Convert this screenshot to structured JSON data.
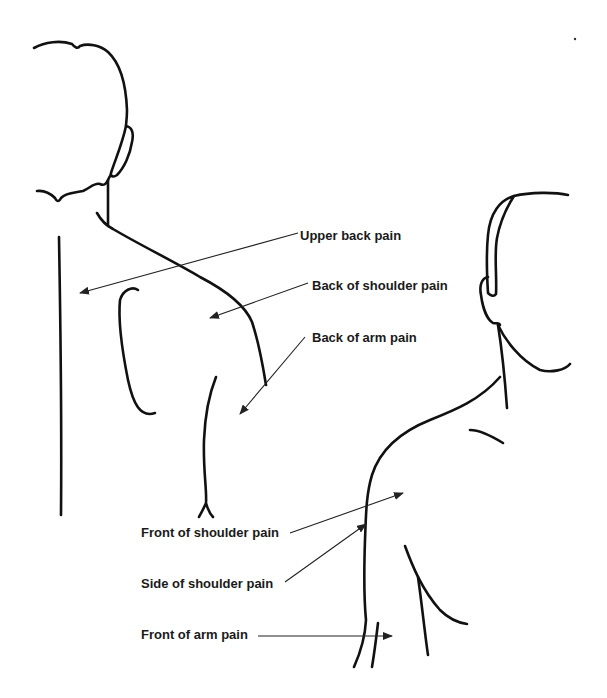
{
  "diagram": {
    "figures": [
      {
        "name": "back-view-figure",
        "view": "back"
      },
      {
        "name": "front-view-figure",
        "view": "front"
      }
    ],
    "labels": [
      {
        "id": "upper-back",
        "text": "Upper back pain",
        "x": 300,
        "y": 229,
        "target": [
          80,
          293
        ]
      },
      {
        "id": "back-shoulder",
        "text": "Back of shoulder pain",
        "x": 312,
        "y": 279,
        "target": [
          210,
          318
        ]
      },
      {
        "id": "back-arm",
        "text": "Back of arm pain",
        "x": 312,
        "y": 331,
        "target": [
          240,
          414
        ]
      },
      {
        "id": "front-shoulder",
        "text": "Front of shoulder pain",
        "x": 141,
        "y": 526,
        "target": [
          403,
          493
        ]
      },
      {
        "id": "side-shoulder",
        "text": "Side of shoulder pain",
        "x": 141,
        "y": 577,
        "target": [
          366,
          524
        ]
      },
      {
        "id": "front-arm",
        "text": "Front of arm pain",
        "x": 141,
        "y": 628,
        "target": [
          392,
          636
        ]
      }
    ],
    "colors": {
      "line": "#111111",
      "text": "#1a1a1a",
      "background": "#ffffff"
    }
  }
}
